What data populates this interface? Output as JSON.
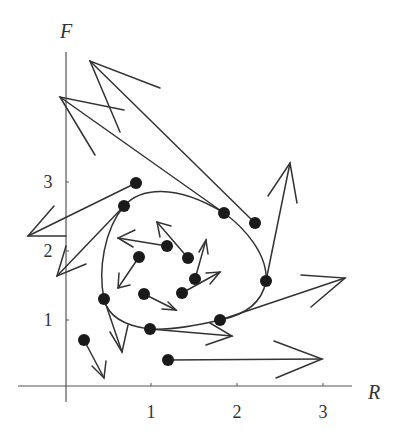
{
  "chart_data": {
    "type": "scatter",
    "subtype": "phase-plane vector field with trajectory",
    "title": "",
    "xlabel": "R",
    "ylabel": "F",
    "xticks": [
      1,
      2,
      3
    ],
    "yticks": [
      1,
      2,
      3
    ],
    "xlim": [
      0,
      3.3
    ],
    "ylim": [
      0,
      4.8
    ],
    "grid": false,
    "legend": null,
    "points": [
      {
        "R": 0.81,
        "F": 2.96,
        "dR": -1.26,
        "dF": -0.77
      },
      {
        "R": 0.67,
        "F": 2.63,
        "dR": -0.78,
        "dF": -1.02
      },
      {
        "R": 1.84,
        "F": 2.53,
        "dR": -1.91,
        "dF": 1.69
      },
      {
        "R": 2.2,
        "F": 2.38,
        "dR": -1.91,
        "dF": 2.36
      },
      {
        "R": 2.33,
        "F": 1.53,
        "dR": 0.28,
        "dF": 1.72
      },
      {
        "R": 1.79,
        "F": 0.96,
        "dR": 1.45,
        "dF": 0.61
      },
      {
        "R": 0.98,
        "F": 0.83,
        "dR": 0.95,
        "dF": -0.1
      },
      {
        "R": 0.44,
        "F": 1.27,
        "dR": 0.21,
        "dF": -0.77
      },
      {
        "R": 0.21,
        "F": 0.67,
        "dR": 0.23,
        "dF": -0.55
      },
      {
        "R": 1.19,
        "F": 0.38,
        "dR": 1.79,
        "dF": 0.01
      },
      {
        "R": 1.17,
        "F": 2.04,
        "dR": -0.57,
        "dF": 0.12
      },
      {
        "R": 1.42,
        "F": 1.87,
        "dR": -0.36,
        "dF": 0.53
      },
      {
        "R": 0.85,
        "F": 1.88,
        "dR": -0.24,
        "dF": -0.45
      },
      {
        "R": 1.5,
        "F": 1.56,
        "dR": 0.13,
        "dF": 0.57
      },
      {
        "R": 1.35,
        "F": 1.36,
        "dR": 0.44,
        "dF": 0.31
      },
      {
        "R": 0.91,
        "F": 1.34,
        "dR": 0.37,
        "dF": -0.23
      }
    ],
    "trajectory": "closed orbit (limit cycle) passing through several sample points"
  },
  "axes": {
    "x_label": "R",
    "y_label": "F",
    "x_ticks": [
      {
        "label": "1",
        "px": 151
      },
      {
        "label": "2",
        "px": 237
      },
      {
        "label": "3",
        "px": 323
      }
    ],
    "y_ticks": [
      {
        "label": "1",
        "py": 320
      },
      {
        "label": "2",
        "py": 251
      },
      {
        "label": "3",
        "py": 182
      }
    ]
  },
  "render": {
    "color": "#333333",
    "origin_px": [
      66,
      386
    ],
    "px_per_R": 86,
    "px_per_F": 68.6,
    "arrows_px": [
      {
        "from": [
          136,
          183
        ],
        "to": [
          28,
          236
        ],
        "b1": [
          54,
          206
        ],
        "b2": [
          66,
          236
        ]
      },
      {
        "from": [
          124,
          206
        ],
        "to": [
          57,
          276
        ],
        "b1": [
          66,
          246
        ],
        "b2": [
          86,
          264
        ]
      },
      {
        "from": [
          224,
          213
        ],
        "to": [
          60,
          97
        ],
        "b1": [
          124,
          110
        ],
        "b2": [
          95,
          155
        ]
      },
      {
        "from": [
          255,
          223
        ],
        "to": [
          90,
          61
        ],
        "b1": [
          160,
          88
        ],
        "b2": [
          120,
          132
        ]
      },
      {
        "from": [
          266,
          281
        ],
        "to": [
          290,
          163
        ],
        "b1": [
          268,
          196
        ],
        "b2": [
          297,
          203
        ]
      },
      {
        "from": [
          220,
          320
        ],
        "to": [
          345,
          278
        ],
        "b1": [
          301,
          275
        ],
        "b2": [
          311,
          307
        ]
      },
      {
        "from": [
          150,
          329
        ],
        "to": [
          232,
          336
        ],
        "b1": [
          210,
          323
        ],
        "b2": [
          206,
          345
        ]
      },
      {
        "from": [
          104,
          299
        ],
        "to": [
          122,
          352
        ],
        "b1": [
          110,
          332
        ],
        "b2": [
          128,
          325
        ]
      },
      {
        "from": [
          84,
          340
        ],
        "to": [
          104,
          378
        ],
        "b1": [
          92,
          366
        ],
        "b2": [
          106,
          361
        ]
      },
      {
        "from": [
          168,
          360
        ],
        "to": [
          322,
          359
        ],
        "b1": [
          274,
          341
        ],
        "b2": [
          276,
          378
        ]
      },
      {
        "from": [
          167,
          246
        ],
        "to": [
          118,
          238
        ],
        "b1": [
          135,
          230
        ],
        "b2": [
          133,
          247
        ]
      },
      {
        "from": [
          188,
          258
        ],
        "to": [
          157,
          222
        ],
        "b1": [
          160,
          237
        ],
        "b2": [
          171,
          226
        ]
      },
      {
        "from": [
          139,
          257
        ],
        "to": [
          118,
          288
        ],
        "b1": [
          119,
          273
        ],
        "b2": [
          130,
          285
        ]
      },
      {
        "from": [
          195,
          279
        ],
        "to": [
          206,
          240
        ],
        "b1": [
          199,
          252
        ],
        "b2": [
          208,
          254
        ]
      },
      {
        "from": [
          182,
          293
        ],
        "to": [
          220,
          272
        ],
        "b1": [
          206,
          273
        ],
        "b2": [
          210,
          284
        ]
      },
      {
        "from": [
          144,
          294
        ],
        "to": [
          176,
          310
        ],
        "b1": [
          162,
          309
        ],
        "b2": [
          168,
          302
        ]
      }
    ],
    "orbit_path": "M124,206 C140,188 175,183 224,213 C245,228 268,255 266,281 C262,303 245,315 220,320 C195,326 168,330 150,329 C125,326 108,316 104,299 C98,270 104,230 124,206 Z"
  }
}
